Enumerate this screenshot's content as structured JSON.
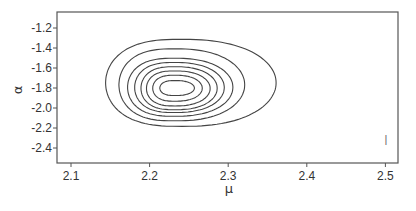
{
  "chart_data": {
    "type": "contour",
    "title": "",
    "xlabel": "μ",
    "ylabel": "α",
    "xlim": [
      2.083,
      2.515
    ],
    "ylim": [
      -2.55,
      -1.04
    ],
    "xticks": [
      2.1,
      2.2,
      2.3,
      2.4,
      2.5
    ],
    "xtick_labels": [
      "2.1",
      "2.2",
      "2.3",
      "2.4",
      "2.5"
    ],
    "yticks": [
      -1.2,
      -1.4,
      -1.6,
      -1.8,
      -2.0,
      -2.2,
      -2.4
    ],
    "ytick_labels": [
      "-1.2",
      "-1.4",
      "-1.6",
      "-1.8",
      "-2.0",
      "-2.2",
      "-2.4"
    ],
    "grid": false,
    "legend": null,
    "center": {
      "mu": 2.3,
      "alpha": -1.79
    },
    "contours": [
      {
        "level": 1,
        "mu_min": 2.213,
        "mu_max": 2.257,
        "alpha_min": -1.88,
        "alpha_max": -1.73
      },
      {
        "level": 2,
        "mu_min": 2.204,
        "mu_max": 2.267,
        "alpha_min": -1.94,
        "alpha_max": -1.68
      },
      {
        "level": 3,
        "mu_min": 2.196,
        "mu_max": 2.277,
        "alpha_min": -1.99,
        "alpha_max": -1.64
      },
      {
        "level": 4,
        "mu_min": 2.189,
        "mu_max": 2.286,
        "alpha_min": -2.03,
        "alpha_max": -1.6
      },
      {
        "level": 5,
        "mu_min": 2.181,
        "mu_max": 2.295,
        "alpha_min": -2.06,
        "alpha_max": -1.56
      },
      {
        "level": 6,
        "mu_min": 2.172,
        "mu_max": 2.306,
        "alpha_min": -2.1,
        "alpha_max": -1.52
      },
      {
        "level": 7,
        "mu_min": 2.161,
        "mu_max": 2.321,
        "alpha_min": -2.15,
        "alpha_max": -1.43
      },
      {
        "level": 8,
        "mu_min": 2.144,
        "mu_max": 2.361,
        "alpha_min": -2.21,
        "alpha_max": -1.34
      }
    ],
    "annotations": [
      {
        "text": "|",
        "mu": 2.5,
        "alpha": -2.37
      }
    ]
  },
  "labels": {
    "xlabel": "μ",
    "ylabel": "α",
    "annotation_mark": "|"
  }
}
